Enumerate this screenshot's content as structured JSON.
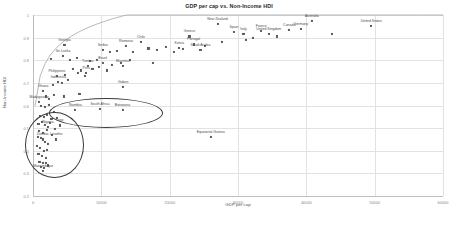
{
  "chart_data": {
    "type": "scatter",
    "title": "GDP per cap vs. Non-Income HDI",
    "xlabel": "GDP per cap",
    "ylabel": "Non-Income HDI",
    "xlim": [
      0,
      60000
    ],
    "ylim": [
      0.2,
      1.0
    ],
    "xticks": [
      "0",
      "10000",
      "20000",
      "30000",
      "40000",
      "50000",
      "60000"
    ],
    "xtick_values": [
      0,
      10000,
      20000,
      30000,
      40000,
      50000,
      60000
    ],
    "yticks": [
      "0.2",
      "0.3",
      "0.4",
      "0.5",
      "0.6",
      "0.7",
      "0.8",
      "0.9",
      "1"
    ],
    "ytick_values": [
      0.2,
      0.3,
      0.4,
      0.5,
      0.6,
      0.7,
      0.8,
      0.9,
      1.0
    ],
    "grid": true,
    "legend": "none",
    "marker_color": "#5a5a5a",
    "trendline": {
      "type": "logarithmic",
      "color": "#9a9a9a"
    },
    "points": [
      {
        "label": "Georgia",
        "x": 4600,
        "y": 0.868,
        "lx": 0,
        "ly": -3
      },
      {
        "label": "Sri Lanka",
        "x": 4400,
        "y": 0.82,
        "lx": 0,
        "ly": -3
      },
      {
        "label": "Serbia",
        "x": 10200,
        "y": 0.845,
        "lx": 0,
        "ly": -3
      },
      {
        "label": "Romania",
        "x": 13600,
        "y": 0.862,
        "lx": 0,
        "ly": -3
      },
      {
        "label": "Chile",
        "x": 15800,
        "y": 0.88,
        "lx": 0,
        "ly": -3
      },
      {
        "label": "Greece",
        "x": 22900,
        "y": 0.905,
        "lx": 0,
        "ly": -3
      },
      {
        "label": "Portugal",
        "x": 23500,
        "y": 0.87,
        "lx": 0,
        "ly": -3
      },
      {
        "label": "Korea",
        "x": 21400,
        "y": 0.855,
        "lx": 0,
        "ly": -3
      },
      {
        "label": "Saudi Arabia",
        "x": 24500,
        "y": 0.845,
        "lx": 0,
        "ly": -3
      },
      {
        "label": "Spain",
        "x": 29400,
        "y": 0.925,
        "lx": 0,
        "ly": -3
      },
      {
        "label": "New Zealand",
        "x": 27000,
        "y": 0.96,
        "lx": 0,
        "ly": -3
      },
      {
        "label": "Italy",
        "x": 30800,
        "y": 0.916,
        "lx": 0,
        "ly": -3
      },
      {
        "label": "France",
        "x": 33400,
        "y": 0.928,
        "lx": 0,
        "ly": -3
      },
      {
        "label": "United Kingdom",
        "x": 34500,
        "y": 0.916,
        "lx": 0,
        "ly": -3
      },
      {
        "label": "Australia",
        "x": 40800,
        "y": 0.975,
        "lx": 0,
        "ly": -3
      },
      {
        "label": "Germany",
        "x": 39200,
        "y": 0.938,
        "lx": 0,
        "ly": -3
      },
      {
        "label": "Canada",
        "x": 37500,
        "y": 0.932,
        "lx": 0,
        "ly": -3
      },
      {
        "label": "United States",
        "x": 49500,
        "y": 0.95,
        "lx": 0,
        "ly": -3
      },
      {
        "label": "Philippines",
        "x": 3500,
        "y": 0.73,
        "lx": 0,
        "ly": -3
      },
      {
        "label": "Peru",
        "x": 7800,
        "y": 0.745,
        "lx": 0,
        "ly": -3
      },
      {
        "label": "Indonesia",
        "x": 3700,
        "y": 0.705,
        "lx": 0,
        "ly": -3
      },
      {
        "label": "Tunisia",
        "x": 8000,
        "y": 0.775,
        "lx": 0,
        "ly": -3
      },
      {
        "label": "Brazil",
        "x": 10200,
        "y": 0.79,
        "lx": 0,
        "ly": -3
      },
      {
        "label": "Mauritius",
        "x": 13200,
        "y": 0.775,
        "lx": 0,
        "ly": -3
      },
      {
        "label": "Ghana",
        "x": 1500,
        "y": 0.665,
        "lx": 0,
        "ly": -3
      },
      {
        "label": "Madagascar",
        "x": 900,
        "y": 0.615,
        "lx": 0,
        "ly": -3
      },
      {
        "label": "Botswana",
        "x": 13100,
        "y": 0.582,
        "lx": 0,
        "ly": -3
      },
      {
        "label": "South Africa",
        "x": 9800,
        "y": 0.585,
        "lx": 0,
        "ly": -3
      },
      {
        "label": "Namibia",
        "x": 6200,
        "y": 0.58,
        "lx": 0,
        "ly": -3
      },
      {
        "label": "Gabon",
        "x": 13200,
        "y": 0.68,
        "lx": 0,
        "ly": -3
      },
      {
        "label": "Equatorial Guinea",
        "x": 26000,
        "y": 0.46,
        "lx": 0,
        "ly": -3
      },
      {
        "label": "Nigeria",
        "x": 2200,
        "y": 0.505,
        "lx": 0,
        "ly": -3
      },
      {
        "label": "Togo",
        "x": 3900,
        "y": 0.512,
        "lx": 0,
        "ly": -3
      },
      {
        "label": "Zambia",
        "x": 1400,
        "y": 0.45,
        "lx": 0,
        "ly": -3
      },
      {
        "label": "Lesotho",
        "x": 3400,
        "y": 0.45,
        "lx": 0,
        "ly": -3
      },
      {
        "label": "Mozambique",
        "x": 1500,
        "y": 0.312,
        "lx": 0,
        "ly": -3
      }
    ],
    "unlabeled_points": [
      {
        "x": 2600,
        "y": 0.805
      },
      {
        "x": 5400,
        "y": 0.8
      },
      {
        "x": 6400,
        "y": 0.812
      },
      {
        "x": 8400,
        "y": 0.795
      },
      {
        "x": 9400,
        "y": 0.8
      },
      {
        "x": 11200,
        "y": 0.836
      },
      {
        "x": 12300,
        "y": 0.842
      },
      {
        "x": 14600,
        "y": 0.838
      },
      {
        "x": 16900,
        "y": 0.852
      },
      {
        "x": 18200,
        "y": 0.845
      },
      {
        "x": 19400,
        "y": 0.858
      },
      {
        "x": 20600,
        "y": 0.836
      },
      {
        "x": 22000,
        "y": 0.848
      },
      {
        "x": 25200,
        "y": 0.862
      },
      {
        "x": 27700,
        "y": 0.88
      },
      {
        "x": 31200,
        "y": 0.89
      },
      {
        "x": 32200,
        "y": 0.9
      },
      {
        "x": 35700,
        "y": 0.905
      },
      {
        "x": 43800,
        "y": 0.915
      },
      {
        "x": 5900,
        "y": 0.76
      },
      {
        "x": 7000,
        "y": 0.755
      },
      {
        "x": 8700,
        "y": 0.762
      },
      {
        "x": 9600,
        "y": 0.77
      },
      {
        "x": 11500,
        "y": 0.78
      },
      {
        "x": 12900,
        "y": 0.79
      },
      {
        "x": 14200,
        "y": 0.8
      },
      {
        "x": 4700,
        "y": 0.735
      },
      {
        "x": 6600,
        "y": 0.742
      },
      {
        "x": 7600,
        "y": 0.73
      },
      {
        "x": 2900,
        "y": 0.69
      },
      {
        "x": 4200,
        "y": 0.7
      },
      {
        "x": 5100,
        "y": 0.712
      },
      {
        "x": 1900,
        "y": 0.64
      },
      {
        "x": 2400,
        "y": 0.63
      },
      {
        "x": 3100,
        "y": 0.648
      },
      {
        "x": 1200,
        "y": 0.6
      },
      {
        "x": 1700,
        "y": 0.592
      },
      {
        "x": 2300,
        "y": 0.602
      },
      {
        "x": 3000,
        "y": 0.572
      },
      {
        "x": 1000,
        "y": 0.555
      },
      {
        "x": 1600,
        "y": 0.548
      },
      {
        "x": 2000,
        "y": 0.56
      },
      {
        "x": 2700,
        "y": 0.54
      },
      {
        "x": 3500,
        "y": 0.545
      },
      {
        "x": 800,
        "y": 0.52
      },
      {
        "x": 1300,
        "y": 0.528
      },
      {
        "x": 1800,
        "y": 0.515
      },
      {
        "x": 2500,
        "y": 0.522
      },
      {
        "x": 3200,
        "y": 0.498
      },
      {
        "x": 900,
        "y": 0.488
      },
      {
        "x": 1450,
        "y": 0.48
      },
      {
        "x": 2100,
        "y": 0.49
      },
      {
        "x": 2800,
        "y": 0.47
      },
      {
        "x": 700,
        "y": 0.462
      },
      {
        "x": 1150,
        "y": 0.455
      },
      {
        "x": 1750,
        "y": 0.44
      },
      {
        "x": 2250,
        "y": 0.432
      },
      {
        "x": 600,
        "y": 0.42
      },
      {
        "x": 1050,
        "y": 0.412
      },
      {
        "x": 1550,
        "y": 0.4
      },
      {
        "x": 2050,
        "y": 0.405
      },
      {
        "x": 800,
        "y": 0.385
      },
      {
        "x": 1300,
        "y": 0.378
      },
      {
        "x": 1850,
        "y": 0.37
      },
      {
        "x": 950,
        "y": 0.352
      },
      {
        "x": 1400,
        "y": 0.345
      },
      {
        "x": 1900,
        "y": 0.348
      },
      {
        "x": 1100,
        "y": 0.33
      },
      {
        "x": 1650,
        "y": 0.325
      },
      {
        "x": 2150,
        "y": 0.335
      },
      {
        "x": 4500,
        "y": 0.64
      },
      {
        "x": 6800,
        "y": 0.65
      },
      {
        "x": 17500,
        "y": 0.79
      },
      {
        "x": 10800,
        "y": 0.755
      }
    ],
    "highlight_regions": [
      {
        "name": "middle-income-africa-ellipse",
        "cx": 10500,
        "cy": 0.57,
        "rx": 8200,
        "ry": 0.062
      },
      {
        "name": "low-income-africa-circle",
        "cx": 3000,
        "cy": 0.43,
        "rx": 4100,
        "ry": 0.14
      }
    ]
  }
}
